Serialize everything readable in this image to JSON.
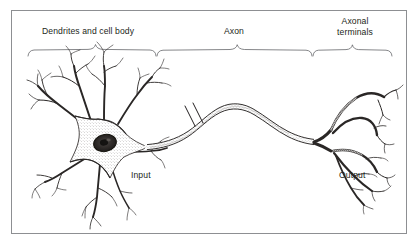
{
  "figure": {
    "frame_color": "#8d8f92",
    "background_color": "#ffffff",
    "ink_color": "#231f20"
  },
  "labels": {
    "dendrites": "Dendrites and cell body",
    "axon": "Axon",
    "terminals_line1": "Axonal",
    "terminals_line2": "terminals",
    "input": "Input",
    "output": "Output"
  },
  "braces": [
    {
      "name": "dendrites-and-cell-body",
      "x_start": 28,
      "x_end": 156,
      "peak_x": 95,
      "y": 56
    },
    {
      "name": "axon",
      "x_start": 157,
      "x_end": 312,
      "peak_x": 237,
      "y": 56
    },
    {
      "name": "axonal-terminals",
      "x_start": 313,
      "x_end": 392,
      "peak_x": 352,
      "y": 56
    }
  ],
  "anatomy": {
    "soma": {
      "center_x": 104,
      "center_y": 146,
      "nucleus": "dark stippled oval",
      "nucleolus": "present"
    },
    "dendrite_count": 7,
    "axon": {
      "break_marks": 2,
      "shape": "s-curve"
    },
    "terminal_branch_count": 6
  }
}
